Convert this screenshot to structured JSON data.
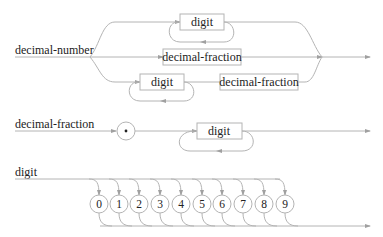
{
  "diagram": {
    "type": "railroad-syntax-diagram",
    "colors": {
      "line": "#b4b4b4",
      "text": "#222222",
      "background": "#ffffff"
    },
    "rules": [
      {
        "name": "decimal-number",
        "alternatives": [
          {
            "items": [
              {
                "kind": "nonterminal",
                "label": "digit",
                "repeat": true
              }
            ]
          },
          {
            "items": [
              {
                "kind": "nonterminal",
                "label": "decimal-fraction"
              }
            ]
          },
          {
            "items": [
              {
                "kind": "nonterminal",
                "label": "digit",
                "repeat": true
              },
              {
                "kind": "nonterminal",
                "label": "decimal-fraction"
              }
            ]
          }
        ]
      },
      {
        "name": "decimal-fraction",
        "sequence": [
          {
            "kind": "terminal",
            "label": "."
          },
          {
            "kind": "nonterminal",
            "label": "digit",
            "repeat": true
          }
        ]
      },
      {
        "name": "digit",
        "choice": [
          "0",
          "1",
          "2",
          "3",
          "4",
          "5",
          "6",
          "7",
          "8",
          "9"
        ]
      }
    ]
  }
}
